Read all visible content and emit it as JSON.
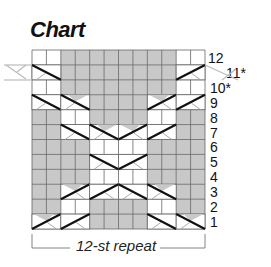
{
  "title": "Chart",
  "repeat_label": "12-st repeat",
  "grid": {
    "columns": 12,
    "rows": 12,
    "colors": {
      "background": "#ffffff",
      "purl_gray": "#c8c8c8",
      "grid_line": "#555555",
      "cable_line": "#111111",
      "tail_line": "#bbbbbb"
    }
  },
  "row_labels": [
    "1",
    "2",
    "3",
    "4",
    "5",
    "6",
    "7",
    "8",
    "9",
    "10*",
    "11*",
    "12"
  ],
  "legend_note": "Rows marked * are worked differently; cable tails extend beyond repeat",
  "rows_pattern": {
    "12": "WWGGGGGGGGWW",
    "11": "CCGGGGGGGGCC",
    "10": "WWGGGGGGGGWW",
    "9": "CCCCGGGGCCCC",
    "8": "GGWWGGGGWWGG",
    "7": "GGCCCCCCCCGG",
    "6": "GGGGWWWWGGGG",
    "5": "GGGGCCCCGGGG",
    "4": "GGGGWWWWGGGG",
    "3": "GGCCCCCCCCGG",
    "2": "GGWWGGGGWWGG",
    "1": "CCCCGGGGCCCC"
  }
}
